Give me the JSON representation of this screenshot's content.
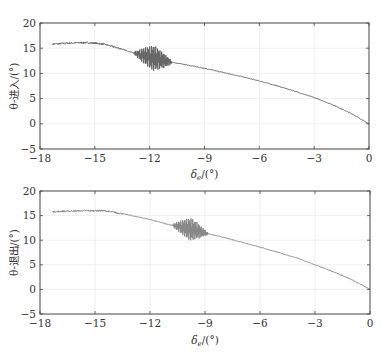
{
  "chart_data": [
    {
      "type": "line",
      "title": "",
      "xlabel": "δe/(°)",
      "ylabel": "θ-进入/(°)",
      "xlim": [
        -18,
        0
      ],
      "ylim": [
        -5,
        20
      ],
      "xticks": [
        -18,
        -15,
        -12,
        -9,
        -6,
        -3,
        0
      ],
      "yticks": [
        -5,
        0,
        5,
        10,
        15,
        20
      ],
      "xtick_labels": [
        "−18",
        "−15",
        "−12",
        "−9",
        "−6",
        "−3",
        "0"
      ],
      "ytick_labels": [
        "−5",
        "0",
        "5",
        "10",
        "15",
        "20"
      ],
      "grid": true,
      "legend": null,
      "series": [
        {
          "name": "θ-进入",
          "color": "#666666",
          "x": [
            -17.3,
            -16.5,
            -15.5,
            -15.0,
            -14.5,
            -14.0,
            -13.5,
            -13.0,
            -12.5,
            -12.0,
            -11.5,
            -11.0,
            -10.5,
            -10.0,
            -9.0,
            -8.0,
            -7.0,
            -6.0,
            -5.0,
            -4.0,
            -3.0,
            -2.0,
            -1.0,
            0.0
          ],
          "y": [
            15.8,
            16.0,
            16.1,
            16.0,
            15.8,
            15.3,
            14.8,
            14.2,
            13.7,
            13.2,
            12.8,
            12.4,
            12.0,
            11.7,
            11.0,
            10.2,
            9.4,
            8.5,
            7.5,
            6.4,
            5.2,
            3.8,
            2.1,
            0.0
          ]
        }
      ],
      "oscillation": {
        "x_start": -13.0,
        "x_end": -10.8,
        "center": -11.8,
        "amplitude": 2.6
      }
    },
    {
      "type": "line",
      "title": "",
      "xlabel": "δe/(°)",
      "ylabel": "θ-退出/(°)",
      "xlim": [
        -18,
        0
      ],
      "ylim": [
        -5,
        20
      ],
      "xticks": [
        -18,
        -15,
        -12,
        -9,
        -6,
        -3,
        0
      ],
      "yticks": [
        -5,
        0,
        5,
        10,
        15,
        20
      ],
      "xtick_labels": [
        "−18",
        "−15",
        "−12",
        "−9",
        "−6",
        "−3",
        "0"
      ],
      "ytick_labels": [
        "−5",
        "0",
        "5",
        "10",
        "15",
        "20"
      ],
      "grid": true,
      "legend": null,
      "series": [
        {
          "name": "θ-退出",
          "color": "#888888",
          "x": [
            -17.3,
            -16.5,
            -15.5,
            -14.5,
            -14.0,
            -13.5,
            -13.0,
            -12.5,
            -12.0,
            -11.5,
            -11.0,
            -10.5,
            -10.0,
            -9.5,
            -9.0,
            -8.5,
            -8.0,
            -7.0,
            -6.0,
            -5.0,
            -4.0,
            -3.0,
            -2.0,
            -1.0,
            0.0
          ],
          "y": [
            15.8,
            15.9,
            16.0,
            16.0,
            15.7,
            15.4,
            15.0,
            14.6,
            14.2,
            13.7,
            13.2,
            12.8,
            12.4,
            12.0,
            11.5,
            11.0,
            10.6,
            9.6,
            8.6,
            7.5,
            6.4,
            5.0,
            3.6,
            2.0,
            0.0
          ]
        }
      ],
      "oscillation": {
        "x_start": -10.8,
        "x_end": -8.8,
        "center": -9.8,
        "amplitude": 2.4
      }
    }
  ],
  "plots": [
    {
      "ylabel": "θ-进入/(°)",
      "xlabel_main": "δ",
      "xlabel_sub": "e",
      "xlabel_rest": "/(°)"
    },
    {
      "ylabel": "θ-退出/(°)",
      "xlabel_main": "δ",
      "xlabel_sub": "e",
      "xlabel_rest": "/(°)"
    }
  ]
}
